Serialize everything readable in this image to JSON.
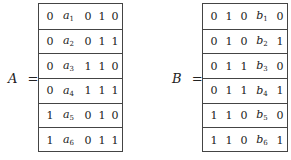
{
  "matrices": [
    {
      "name": "A",
      "equals": "=",
      "symbol": "a",
      "symbol_column": 1,
      "rows": [
        [
          "0",
          "a",
          "0",
          "1",
          "0"
        ],
        [
          "0",
          "a",
          "0",
          "1",
          "1"
        ],
        [
          "0",
          "a",
          "1",
          "1",
          "0"
        ],
        [
          "0",
          "a",
          "1",
          "1",
          "1"
        ],
        [
          "1",
          "a",
          "0",
          "1",
          "0"
        ],
        [
          "1",
          "a",
          "0",
          "1",
          "1"
        ]
      ],
      "subscripts": [
        "1",
        "2",
        "3",
        "4",
        "5",
        "6"
      ]
    },
    {
      "name": "B",
      "equals": "=",
      "symbol": "b",
      "symbol_column": 3,
      "rows": [
        [
          "0",
          "1",
          "0",
          "b",
          "0"
        ],
        [
          "0",
          "1",
          "0",
          "b",
          "1"
        ],
        [
          "0",
          "1",
          "1",
          "b",
          "0"
        ],
        [
          "0",
          "1",
          "1",
          "b",
          "1"
        ],
        [
          "1",
          "1",
          "0",
          "b",
          "0"
        ],
        [
          "1",
          "1",
          "0",
          "b",
          "1"
        ]
      ],
      "subscripts": [
        "1",
        "2",
        "3",
        "4",
        "5",
        "6"
      ]
    }
  ]
}
